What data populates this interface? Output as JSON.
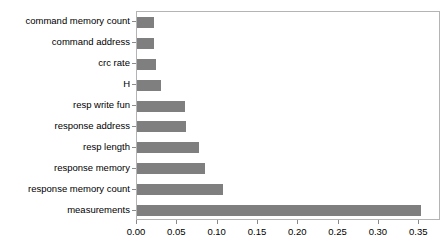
{
  "chart_data": {
    "type": "bar",
    "orientation": "horizontal",
    "title": "",
    "subtitle": "",
    "xlabel": "",
    "ylabel": "",
    "categories": [
      "command memory count",
      "command address",
      "crc rate",
      "H",
      "resp write fun",
      "response address",
      "resp length",
      "response memory",
      "response memory count",
      "measurements"
    ],
    "values": [
      0.021,
      0.021,
      0.024,
      0.03,
      0.06,
      0.061,
      0.077,
      0.084,
      0.107,
      0.352
    ],
    "xlim": [
      0.0,
      0.377
    ],
    "xticks": [
      0.0,
      0.05,
      0.1,
      0.15,
      0.2,
      0.25,
      0.3,
      0.35
    ],
    "xtick_labels": [
      "0.00",
      "0.05",
      "0.10",
      "0.15",
      "0.20",
      "0.25",
      "0.30",
      "0.35"
    ],
    "grid": false,
    "legend": null,
    "bar_color": "#7f7f7f",
    "frame_color": "#b4b4b4"
  }
}
